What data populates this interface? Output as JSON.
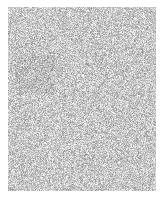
{
  "image": {
    "kind": "random-grayscale-noise",
    "width": 163,
    "height": 205,
    "background_color": "#ffffff",
    "description": "White page containing a single rectangular patch of fine-grained random grayscale pixel noise. No text, icons, charts or interface controls are present."
  },
  "noise_patch": {
    "x": 8,
    "y": 7,
    "width": 148,
    "height": 184,
    "grain_size_px": 1,
    "min_gray": "#888888",
    "max_gray": "#ffffff",
    "mean_gray": "#c8c8c8",
    "min_level": 136,
    "max_level": 255,
    "mean_level": 200,
    "distribution": "uniform-random-per-pixel",
    "seed": 20250419
  },
  "margins": {
    "top": 7,
    "left": 8,
    "right": 7,
    "bottom": 14
  },
  "regions": [
    {
      "name": "upper-left-darker-cluster",
      "x": 15,
      "y": 55,
      "width": 40,
      "height": 40,
      "mean_level": 190,
      "note": "Marginally darker average than surrounding field; consistent with random variation."
    }
  ]
}
